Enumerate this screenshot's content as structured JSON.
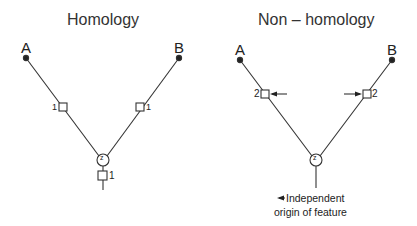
{
  "panels": [
    {
      "title": "Homology",
      "taxon_a": "A",
      "taxon_b": "B",
      "left_branch_label": "1",
      "right_branch_label": "1",
      "node_label": "z",
      "stem_label": "1"
    },
    {
      "title": "Non – homology",
      "taxon_a": "A",
      "taxon_b": "B",
      "left_branch_label": "2",
      "right_branch_label": "2",
      "node_label": "z",
      "annotation_line1": "Independent",
      "annotation_line2": "origin of feature"
    }
  ],
  "colors": {
    "line": "#333333",
    "background": "#ffffff"
  }
}
